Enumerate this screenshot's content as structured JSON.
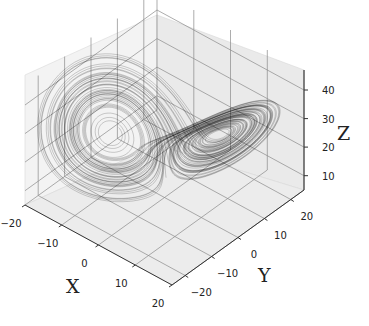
{
  "chart_data": {
    "type": "line3d",
    "title": "",
    "subtitle": "Lorenz attractor (3D trajectory)",
    "xlabel": "X",
    "ylabel": "Y",
    "zlabel": "Z",
    "x_ticks": [
      "−20",
      "−10",
      "0",
      "10",
      "20"
    ],
    "y_ticks": [
      "−20",
      "−10",
      "0",
      "10",
      "20"
    ],
    "z_ticks": [
      "10",
      "20",
      "30",
      "40"
    ],
    "xlim": [
      -20,
      20
    ],
    "ylim": [
      -25,
      25
    ],
    "zlim": [
      5,
      47
    ],
    "grid": true,
    "legend": null,
    "series": [
      {
        "name": "trajectory",
        "color": "#000000",
        "system": "lorenz",
        "params": {
          "sigma": 10,
          "rho": 28,
          "beta": 2.6667
        },
        "description": "Thin dark line tracing two lobes: a large lobe centered near X≈-8 and a denser, flatter lobe near X≈8"
      }
    ]
  },
  "colors": {
    "pane": "#f2f2f2",
    "pane_right": "#e9e9e9",
    "floor": "#ebebeb",
    "grid": "#8a8a8a",
    "line": "#000000",
    "text": "#222222"
  }
}
